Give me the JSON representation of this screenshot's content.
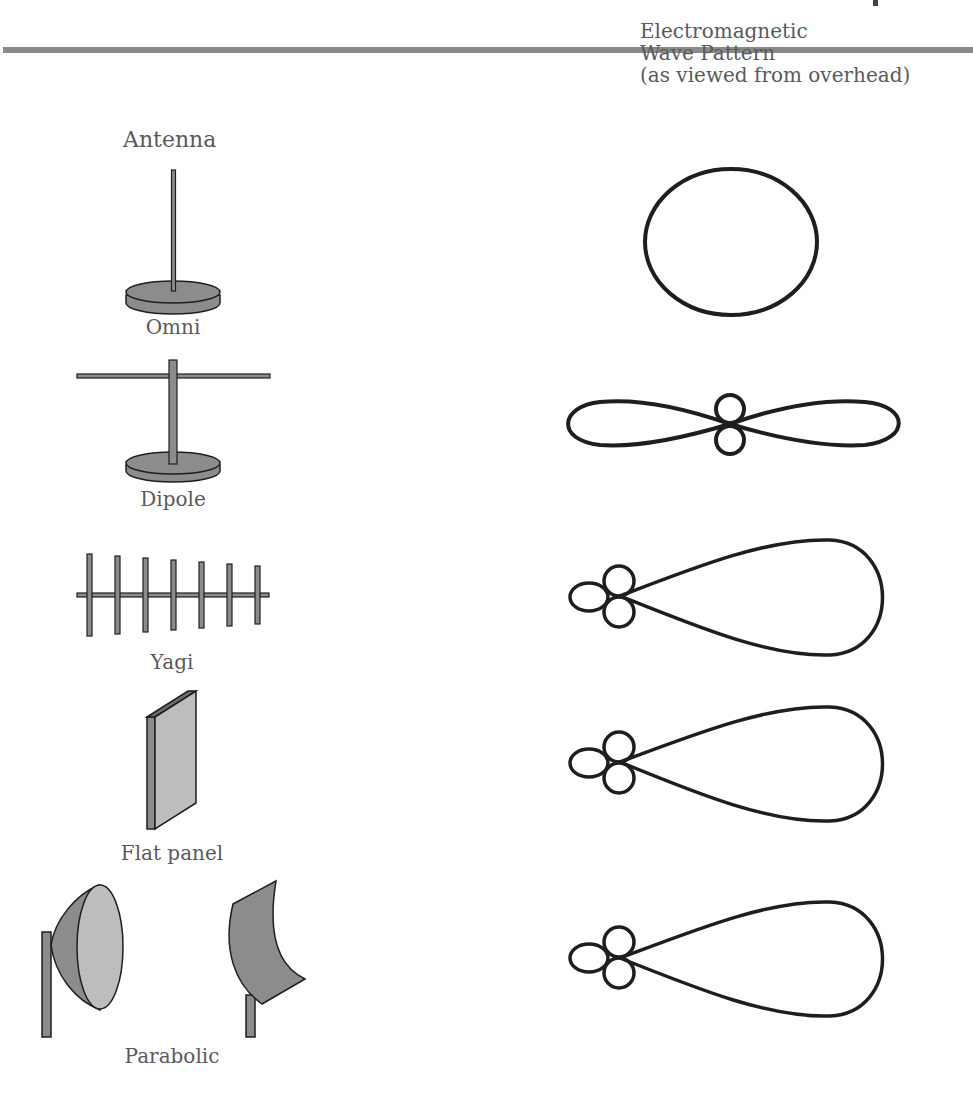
{
  "page": {
    "header_rule_color": "#8a8a8a"
  },
  "headers": {
    "antenna": "Antenna",
    "pattern_line1": "Electromagnetic",
    "pattern_line2": "Wave Pattern",
    "pattern_line3": "(as viewed from overhead)"
  },
  "antennas": [
    {
      "label": "Omni",
      "pattern": "omnidirectional circle"
    },
    {
      "label": "Dipole",
      "pattern": "figure-eight with two small side lobes"
    },
    {
      "label": "Yagi",
      "pattern": "directional main lobe with three back lobes"
    },
    {
      "label": "Flat panel",
      "pattern": "directional main lobe with three back lobes"
    },
    {
      "label": "Parabolic",
      "pattern": "directional main lobe with three back lobes"
    }
  ],
  "colors": {
    "fill_dark": "#8c8c8c",
    "fill_light": "#bdbdbd",
    "stroke": "#1e1e1e",
    "text": "#5a5a5a"
  }
}
